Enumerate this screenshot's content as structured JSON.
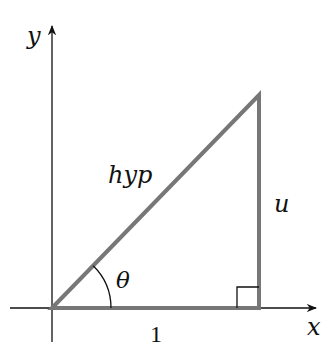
{
  "diagram": {
    "type": "right-triangle",
    "axes": {
      "x_label": "x",
      "y_label": "y"
    },
    "labels": {
      "hypotenuse": "hyp",
      "opposite": "u",
      "adjacent": "1",
      "angle": "θ"
    },
    "colors": {
      "triangle_stroke": "#777777",
      "axis_stroke": "#111111",
      "text": "#111111"
    }
  }
}
